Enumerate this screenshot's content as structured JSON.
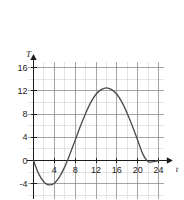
{
  "chart_data": {
    "type": "line",
    "title": "",
    "subtitle": "",
    "xlabel": "t",
    "ylabel": "T",
    "xlim": [
      -2,
      26
    ],
    "ylim": [
      -7,
      18
    ],
    "grid": true,
    "grid_major_step_x": 4,
    "grid_minor_step_x": 2,
    "grid_major_step_y": 4,
    "grid_minor_step_y": 2,
    "legend": "none",
    "x_ticks": [
      4,
      8,
      12,
      16,
      20,
      24
    ],
    "y_ticks": [
      -4,
      0,
      4,
      8,
      12,
      16
    ],
    "x_tick_labels": [
      "4",
      "8",
      "12",
      "16",
      "20",
      "24"
    ],
    "y_tick_labels": [
      "-4",
      "0",
      "4",
      "8",
      "12",
      "16"
    ],
    "annotations": [],
    "series": [
      {
        "name": "T(t)",
        "color": "#4a4a4a",
        "x": [
          0,
          1,
          2,
          3,
          4,
          5,
          6,
          7,
          8,
          9,
          10,
          11,
          12,
          13,
          14,
          15,
          16,
          17,
          18,
          19,
          20,
          21,
          22,
          23,
          24
        ],
        "values": [
          0,
          -2.3,
          -3.7,
          -4.2,
          -3.9,
          -2.8,
          -1.1,
          1.1,
          3.5,
          5.9,
          8.1,
          10.0,
          11.4,
          12.2,
          12.5,
          12.2,
          11.4,
          10.0,
          8.1,
          5.9,
          3.5,
          1.1,
          -0.2,
          -0.2,
          0
        ]
      }
    ],
    "curve_features": {
      "start_point": [
        0,
        0
      ],
      "minimum": [
        3,
        -4.2
      ],
      "maximum": [
        14,
        12.5
      ],
      "end_point": [
        24,
        0
      ]
    }
  },
  "colors": {
    "background": "#ffffff",
    "curve": "#4a4a4a",
    "axis": "#1c1c1c",
    "grid_major": "#8d8d8d",
    "grid_minor": "#cfcfcf",
    "text": "#1c1c1c"
  }
}
